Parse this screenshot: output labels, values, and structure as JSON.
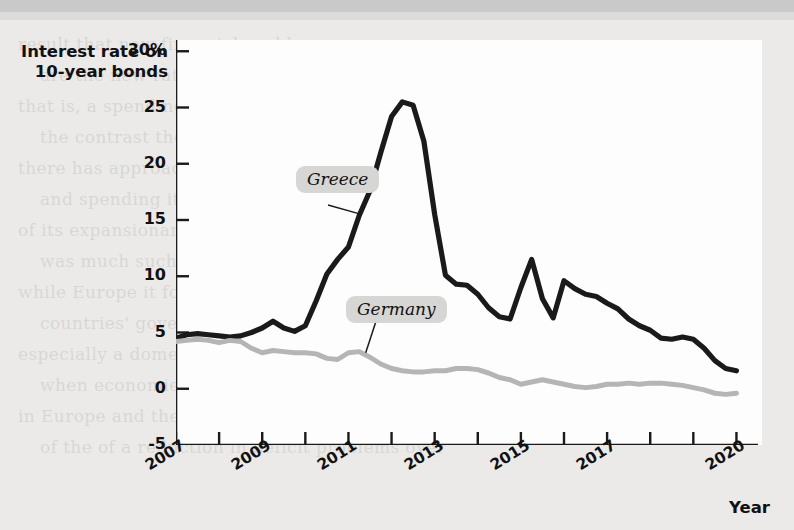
{
  "chart_data": {
    "type": "line",
    "title": "",
    "ylabel": "Interest rate on 10-year bonds",
    "xlabel": "Year",
    "ylim": [
      -5,
      31
    ],
    "xlim": [
      2007,
      2020.5
    ],
    "grid": false,
    "legend_position": "inline-callout",
    "y_ticks": [
      "30%",
      "25",
      "20",
      "15",
      "10",
      "5",
      "0",
      "-5"
    ],
    "y_tick_values": [
      30,
      25,
      20,
      15,
      10,
      5,
      0,
      -5
    ],
    "x_ticks": [
      "2007",
      "2009",
      "2011",
      "2013",
      "2015",
      "2017",
      "2020"
    ],
    "x_tick_values": [
      2007,
      2009,
      2011,
      2013,
      2015,
      2017,
      2020
    ],
    "x_minor_tick_values": [
      2008,
      2010,
      2012,
      2014,
      2016,
      2018,
      2019
    ],
    "series": [
      {
        "name": "Greece",
        "color": "#1a1a1a",
        "x": [
          2007.0,
          2007.25,
          2007.5,
          2007.75,
          2008.0,
          2008.25,
          2008.5,
          2008.75,
          2009.0,
          2009.25,
          2009.5,
          2009.75,
          2010.0,
          2010.25,
          2010.5,
          2010.75,
          2011.0,
          2011.25,
          2011.5,
          2011.75,
          2012.0,
          2012.25,
          2012.5,
          2012.75,
          2013.0,
          2013.25,
          2013.5,
          2013.75,
          2014.0,
          2014.25,
          2014.5,
          2014.75,
          2015.0,
          2015.25,
          2015.5,
          2015.75,
          2016.0,
          2016.25,
          2016.5,
          2016.75,
          2017.0,
          2017.25,
          2017.5,
          2017.75,
          2018.0,
          2018.25,
          2018.5,
          2018.75,
          2019.0,
          2019.25,
          2019.5,
          2019.75,
          2020.0
        ],
        "y": [
          4.5,
          4.8,
          4.9,
          4.8,
          4.7,
          4.6,
          4.7,
          5.0,
          5.4,
          6.0,
          5.4,
          5.1,
          5.6,
          7.8,
          10.2,
          11.5,
          12.6,
          15.4,
          17.6,
          21.0,
          24.2,
          25.5,
          25.2,
          22.0,
          15.5,
          10.1,
          9.3,
          9.2,
          8.4,
          7.2,
          6.4,
          6.2,
          9.0,
          11.5,
          8.0,
          6.3,
          9.6,
          8.9,
          8.4,
          8.2,
          7.6,
          7.1,
          6.2,
          5.6,
          5.2,
          4.5,
          4.4,
          4.6,
          4.4,
          3.6,
          2.5,
          1.8,
          1.6
        ]
      },
      {
        "name": "Germany",
        "color": "#b5b5b5",
        "x": [
          2007.0,
          2007.25,
          2007.5,
          2007.75,
          2008.0,
          2008.25,
          2008.5,
          2008.75,
          2009.0,
          2009.25,
          2009.5,
          2009.75,
          2010.0,
          2010.25,
          2010.5,
          2010.75,
          2011.0,
          2011.25,
          2011.5,
          2011.75,
          2012.0,
          2012.25,
          2012.5,
          2012.75,
          2013.0,
          2013.25,
          2013.5,
          2013.75,
          2014.0,
          2014.25,
          2014.5,
          2014.75,
          2015.0,
          2015.25,
          2015.5,
          2015.75,
          2016.0,
          2016.25,
          2016.5,
          2016.75,
          2017.0,
          2017.25,
          2017.5,
          2017.75,
          2018.0,
          2018.25,
          2018.5,
          2018.75,
          2019.0,
          2019.25,
          2019.5,
          2019.75,
          2020.0
        ],
        "y": [
          4.2,
          4.3,
          4.4,
          4.3,
          4.1,
          4.3,
          4.2,
          3.6,
          3.2,
          3.4,
          3.3,
          3.2,
          3.2,
          3.1,
          2.7,
          2.6,
          3.2,
          3.3,
          2.8,
          2.2,
          1.8,
          1.6,
          1.5,
          1.5,
          1.6,
          1.6,
          1.8,
          1.8,
          1.7,
          1.4,
          1.0,
          0.8,
          0.4,
          0.6,
          0.8,
          0.6,
          0.4,
          0.2,
          0.1,
          0.2,
          0.4,
          0.4,
          0.5,
          0.4,
          0.5,
          0.5,
          0.4,
          0.3,
          0.1,
          -0.1,
          -0.4,
          -0.5,
          -0.4
        ]
      }
    ],
    "annotations": [
      {
        "name": "Greece",
        "text": "Greece",
        "leader_to_year": 2011.3,
        "leader_to_value": 15.5
      },
      {
        "name": "Germany",
        "text": "Germany",
        "leader_to_year": 2011.4,
        "leader_to_value": 3.2
      }
    ]
  },
  "axis": {
    "y_title_line1": "Interest rate on",
    "y_title_line2": "10-year bonds",
    "x_title": "Year"
  },
  "colors": {
    "greece": "#1a1a1a",
    "germany": "#b5b5b5",
    "axis": "#1a1a1a",
    "plot_bg": "#fdfdfd",
    "page_bg": "#ebeae8",
    "callout_bg": "#d6d6d4"
  },
  "background_text": {
    "lines": [
      "result that new financial problems",
      "are the new rate and new spending",
      "that is, a spending rate reduced by",
      "the contrast the that",
      "there has approach it tries a necessary",
      "and spending it can a budget points to show",
      "of its expansionary period. However, in other cases",
      "was much such of practice in the United States",
      "while Europe it found similar to that than area",
      "countries' governments of the debt has suffered the",
      "especially a domestic policy, interest rates sharply",
      "when economies the government of policy with the",
      "in Europe and the 2010 a major and the crisis a set",
      "of the of a reduction in deficit problems over"
    ]
  }
}
